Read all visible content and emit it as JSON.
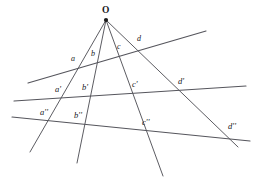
{
  "figure": {
    "width": 255,
    "height": 189,
    "background_color": "#ffffff",
    "line_color": "#55555c",
    "ray_color": "#4a4a50",
    "label_color": "#16161a"
  },
  "apex": {
    "label": "O",
    "x": 106,
    "y": 20,
    "label_x": 102,
    "label_y": 6
  },
  "rays": [
    {
      "name": "ray-a",
      "x1": 106,
      "y1": 20,
      "x2": 30,
      "y2": 152
    },
    {
      "name": "ray-b",
      "x1": 106,
      "y1": 20,
      "x2": 77,
      "y2": 163
    },
    {
      "name": "ray-c",
      "x1": 106,
      "y1": 20,
      "x2": 163,
      "y2": 176
    },
    {
      "name": "ray-d",
      "x1": 106,
      "y1": 20,
      "x2": 238,
      "y2": 147
    }
  ],
  "transversals": [
    {
      "name": "transversal-1",
      "x1": 28,
      "y1": 83,
      "x2": 206,
      "y2": 31
    },
    {
      "name": "transversal-2",
      "x1": 14,
      "y1": 101,
      "x2": 246,
      "y2": 86
    },
    {
      "name": "transversal-3",
      "x1": 12,
      "y1": 117,
      "x2": 250,
      "y2": 141
    }
  ],
  "labels": {
    "tier1": [
      {
        "text": "a",
        "x": 71,
        "y": 55
      },
      {
        "text": "b",
        "x": 91,
        "y": 50
      },
      {
        "text": "c",
        "x": 117,
        "y": 43
      },
      {
        "text": "d",
        "x": 137,
        "y": 35
      }
    ],
    "tier2": [
      {
        "text": "a'",
        "x": 55,
        "y": 85
      },
      {
        "text": "b'",
        "x": 82,
        "y": 83
      },
      {
        "text": "c'",
        "x": 132,
        "y": 80
      },
      {
        "text": "d'",
        "x": 178,
        "y": 77
      }
    ],
    "tier3": [
      {
        "text": "a''",
        "x": 40,
        "y": 108
      },
      {
        "text": "b''",
        "x": 74,
        "y": 111
      },
      {
        "text": "c''",
        "x": 142,
        "y": 118
      },
      {
        "text": "d''",
        "x": 228,
        "y": 122
      }
    ]
  }
}
